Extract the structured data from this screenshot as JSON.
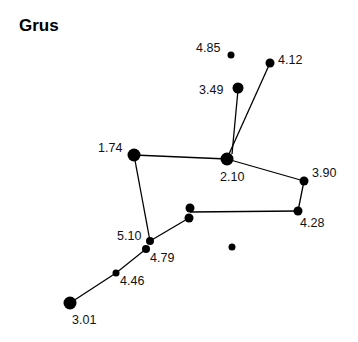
{
  "title": "Grus",
  "stars": [
    {
      "id": "s485",
      "label": "4.85",
      "x": 231,
      "y": 55,
      "r": 3.5,
      "lx": 196,
      "ly": 52
    },
    {
      "id": "s412",
      "label": "4.12",
      "x": 270,
      "y": 63,
      "r": 4.5,
      "lx": 278,
      "ly": 64
    },
    {
      "id": "s349",
      "label": "3.49",
      "x": 238,
      "y": 88,
      "r": 5.5,
      "lx": 199,
      "ly": 94
    },
    {
      "id": "s174",
      "label": "1.74",
      "x": 134,
      "y": 155,
      "r": 6.5,
      "lx": 98,
      "ly": 152
    },
    {
      "id": "s210",
      "label": "2.10",
      "x": 227,
      "y": 159,
      "r": 6.5,
      "lx": 220,
      "ly": 181
    },
    {
      "id": "s390",
      "label": "3.90",
      "x": 304,
      "y": 181,
      "r": 4.5,
      "lx": 312,
      "ly": 177
    },
    {
      "id": "s428",
      "label": "4.28",
      "x": 298,
      "y": 211,
      "r": 4.5,
      "lx": 300,
      "ly": 227
    },
    {
      "id": "sa",
      "label": "",
      "x": 190,
      "y": 208,
      "r": 4.5,
      "lx": 0,
      "ly": 0
    },
    {
      "id": "sb",
      "label": "",
      "x": 189,
      "y": 218,
      "r": 4.5,
      "lx": 0,
      "ly": 0
    },
    {
      "id": "s510",
      "label": "5.10",
      "x": 150,
      "y": 241,
      "r": 4,
      "lx": 117,
      "ly": 240
    },
    {
      "id": "s479",
      "label": "4.79",
      "x": 146,
      "y": 249,
      "r": 4,
      "lx": 150,
      "ly": 262
    },
    {
      "id": "sc",
      "label": "",
      "x": 232,
      "y": 247,
      "r": 3.5,
      "lx": 0,
      "ly": 0
    },
    {
      "id": "s446",
      "label": "4.46",
      "x": 116,
      "y": 273,
      "r": 3.5,
      "lx": 120,
      "ly": 285
    },
    {
      "id": "s301",
      "label": "3.01",
      "x": 70,
      "y": 303,
      "r": 6.5,
      "lx": 72,
      "ly": 324
    }
  ],
  "lines": [
    [
      232,
      154,
      238,
      90
    ],
    [
      229,
      154,
      270,
      63
    ],
    [
      134,
      155,
      227,
      159
    ],
    [
      227,
      159,
      304,
      181
    ],
    [
      304,
      181,
      298,
      211
    ],
    [
      298,
      211,
      190,
      212
    ],
    [
      134,
      155,
      150,
      241
    ],
    [
      150,
      241,
      189,
      218
    ],
    [
      146,
      249,
      116,
      273
    ],
    [
      116,
      273,
      70,
      303
    ]
  ]
}
